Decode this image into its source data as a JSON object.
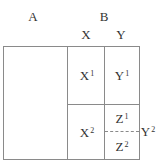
{
  "header": {
    "col_a": "A",
    "col_b": "B",
    "sub_x": "X",
    "sub_y": "Y"
  },
  "cells": {
    "x1": {
      "base": "X",
      "sup": "1"
    },
    "y1": {
      "base": "Y",
      "sup": "1"
    },
    "x2": {
      "base": "X",
      "sup": "2"
    },
    "z1": {
      "base": "Z",
      "sup": "1"
    },
    "z2": {
      "base": "Z",
      "sup": "2"
    },
    "y2": {
      "base": "Y",
      "sup": "2"
    }
  },
  "colors": {
    "line": "#8a8a8a",
    "text": "#333333"
  }
}
